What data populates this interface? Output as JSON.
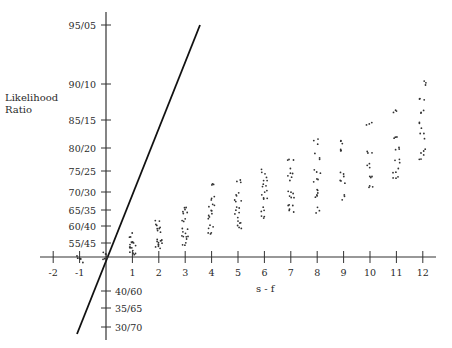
{
  "chart_data": {
    "type": "scatter",
    "title": "",
    "xlabel": "s - f",
    "ylabel": "Likelihood Ratio",
    "xlim": [
      -2,
      12
    ],
    "x_ticks": [
      -2,
      -1,
      1,
      2,
      3,
      4,
      5,
      6,
      7,
      8,
      9,
      10,
      11,
      12
    ],
    "y_ticks_above": [
      "95/05",
      "90/10",
      "85/15",
      "80/20",
      "75/25",
      "70/30",
      "65/35",
      "60/40",
      "55/45"
    ],
    "y_ticks_below": [
      "40/60",
      "35/65",
      "30/70"
    ],
    "grid": false,
    "legend": null,
    "line": {
      "description": "steep straight line through origin",
      "from": [
        -1.1,
        "below 30/70"
      ],
      "to": [
        3.6,
        "95/05"
      ]
    },
    "series": [
      {
        "name": "observations",
        "points_by_x": {
          "-1": [
            "~50/50",
            "~49/51"
          ],
          "0": [
            "~51/49",
            "~50/50",
            "~49/51"
          ],
          "1": [
            "52/48",
            "53/47",
            "54/46",
            "55/45",
            "57/43",
            "51/49"
          ],
          "2": [
            "53/47",
            "54/46",
            "55/45",
            "56/44",
            "58/42",
            "60/40",
            "61/39"
          ],
          "3": [
            "55/45",
            "56/44",
            "57/43",
            "58/42",
            "61/39",
            "63/37",
            "65/35"
          ],
          "4": [
            "58/42",
            "60/40",
            "62/38",
            "64/36",
            "66/34",
            "68/32",
            "72/28"
          ],
          "5": [
            "59/41",
            "61/39",
            "63/37",
            "65/35",
            "67/33",
            "69/31",
            "72/28"
          ],
          "6": [
            "62/38",
            "65/35",
            "67/33",
            "69/31",
            "71/29",
            "73/27",
            "75/25"
          ],
          "7": [
            "64/36",
            "66/34",
            "68/32",
            "70/30",
            "73/27",
            "75/25",
            "77/23"
          ],
          "8": [
            "65/35",
            "68/32",
            "70/30",
            "72/28",
            "75/25",
            "78/22",
            "81/19"
          ],
          "9": [
            "68/32",
            "72/28",
            "74/26",
            "79/21",
            "81/19"
          ],
          "10": [
            "71/29",
            "73/27",
            "76/24",
            "79/21",
            "84/16"
          ],
          "11": [
            "73/27",
            "75/25",
            "77/23",
            "80/20",
            "82/18",
            "86/14"
          ],
          "12": [
            "78/22",
            "79/21",
            "82/18",
            "84/16",
            "86/14",
            "88/12",
            "90/10"
          ]
        }
      }
    ]
  }
}
